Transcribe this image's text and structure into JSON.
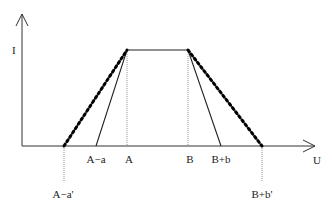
{
  "diagram": {
    "type": "trapezoidal membership function",
    "axes": {
      "y_label": "I",
      "x_label": "U"
    },
    "x_ticks": [
      {
        "key": "a_minus_a_prime",
        "label": "A−a'",
        "x": 64
      },
      {
        "key": "a_minus_a",
        "label": "A−a",
        "x": 96
      },
      {
        "key": "a",
        "label": "A",
        "x": 127
      },
      {
        "key": "b",
        "label": "B",
        "x": 188
      },
      {
        "key": "b_plus_b",
        "label": "B+b",
        "x": 221
      },
      {
        "key": "b_plus_b_prime",
        "label": "B+b'",
        "x": 262
      }
    ],
    "series": [
      {
        "name": "inner trapezoid",
        "style": "solid",
        "points": [
          [
            96,
            146
          ],
          [
            127,
            50
          ],
          [
            188,
            50
          ],
          [
            221,
            146
          ]
        ]
      },
      {
        "name": "outer trapezoid",
        "style": "dotted",
        "points": [
          [
            64,
            146
          ],
          [
            127,
            50
          ],
          [
            188,
            50
          ],
          [
            262,
            146
          ]
        ]
      }
    ]
  },
  "labels": {
    "y_axis": "I",
    "x_axis": "U",
    "a_minus_a_prime": "A−a'",
    "a_minus_a": "A−a",
    "a": "A",
    "b": "B",
    "b_plus_b": "B+b",
    "b_plus_b_prime": "B+b'"
  }
}
